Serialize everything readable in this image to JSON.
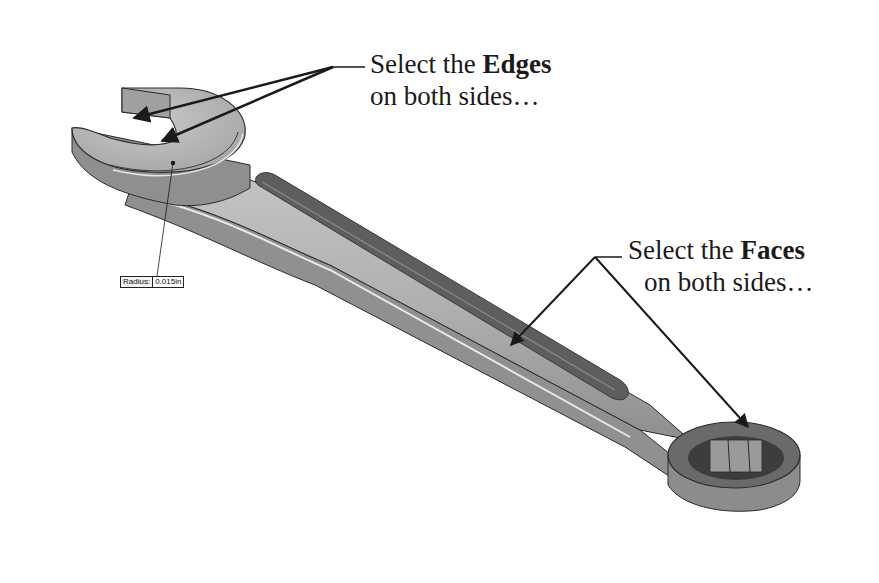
{
  "figure": {
    "colors": {
      "background": "#ffffff",
      "body": "#b9b9b9",
      "body_dark": "#8c8c8c",
      "groove": "#5e5e5e",
      "outline": "#2a2a2a",
      "arrow": "#1a1a1a"
    }
  },
  "callouts": {
    "edges": {
      "line1_prefix": "Select the ",
      "line1_bold": "Edges",
      "line2": "on both sides…"
    },
    "faces": {
      "line1_prefix": "Select the ",
      "line1_bold": "Faces",
      "line2": "on both sides…"
    }
  },
  "radius_tag": {
    "label": "Radius:",
    "value": "0.015in"
  }
}
